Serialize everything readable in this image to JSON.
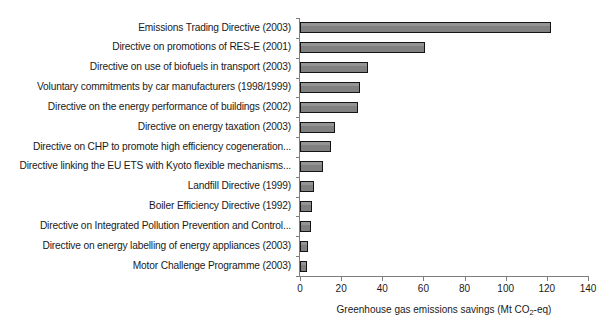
{
  "chart_data": {
    "type": "bar",
    "orientation": "horizontal",
    "title": "",
    "subtitle": "",
    "xlabel": "Greenhouse gas emissions savings (Mt CO2-eq)",
    "xlabel_parts": {
      "before": "Greenhouse gas emissions savings (Mt CO",
      "subscript": "2",
      "after": "-eq)"
    },
    "ylabel": "",
    "xlim": [
      0,
      140
    ],
    "xticks": [
      0,
      20,
      40,
      60,
      80,
      100,
      120,
      140
    ],
    "xtick_labels": [
      "0",
      "20",
      "40",
      "60",
      "80",
      "100",
      "120",
      "140"
    ],
    "grid": false,
    "legend": false,
    "categories": [
      "Emissions Trading Directive (2003)",
      "Directive on promotions of RES-E (2001)",
      "Directive on use of biofuels in transport (2003)",
      "Voluntary commitments by car manufacturers (1998/1999)",
      "Directive on the energy performance of buildings (2002)",
      "Directive on energy taxation (2003)",
      "Directive on CHP to promote high efficiency cogeneration...",
      "Directive linking the EU ETS with Kyoto flexible mechanisms...",
      "Landfill Directive (1999)",
      "Boiler Efficiency Directive (1992)",
      "Directive on Integrated Pollution Prevention and Control...",
      "Directive on energy labelling of energy appliances (2003)",
      "Motor Challenge Programme (2003)"
    ],
    "values": [
      122,
      61,
      33,
      29,
      28,
      17,
      15,
      11,
      7,
      6,
      5.5,
      4,
      3.5
    ],
    "series": [
      {
        "name": "Greenhouse gas emissions savings",
        "values": [
          122,
          61,
          33,
          29,
          28,
          17,
          15,
          11,
          7,
          6,
          5.5,
          4,
          3.5
        ]
      }
    ],
    "colors": {
      "bar_fill": "#808080",
      "bar_edge": "#141414",
      "axis": "#7d7d7d",
      "text": "#1a1a1a",
      "background": "#ffffff"
    }
  }
}
